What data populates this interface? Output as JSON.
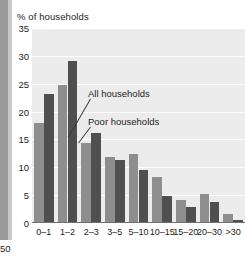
{
  "chart_data": {
    "type": "bar",
    "title": "% of households",
    "xlabel": "",
    "ylabel": "% of households",
    "ylim": [
      0,
      35
    ],
    "yticks": [
      0,
      5,
      10,
      15,
      20,
      25,
      30,
      35
    ],
    "ytick_labels": [
      "0",
      "5",
      "10",
      "15",
      "20",
      "25",
      "30",
      "35"
    ],
    "grid": true,
    "legend_position": "inline-annotations",
    "categories": [
      "0–1",
      "1–2",
      "2–3",
      "3–5",
      "5–10",
      "10–15",
      "15–20",
      "20–30",
      ">30"
    ],
    "series": [
      {
        "name": "All households",
        "color": "#8e8e8e",
        "values": [
          18.0,
          24.8,
          14.3,
          11.8,
          12.3,
          8.2,
          4.2,
          5.2,
          1.7
        ]
      },
      {
        "name": "Poor households",
        "color": "#4f4f4f",
        "values": [
          23.1,
          29.0,
          16.1,
          11.3,
          9.6,
          4.8,
          2.8,
          3.7,
          0.5
        ]
      }
    ],
    "annotations": [
      {
        "text": "All households",
        "target_series": "All households",
        "target_category": "2–3"
      },
      {
        "text": "Poor households",
        "target_series": "Poor households",
        "target_category": "2–3"
      }
    ]
  },
  "neighbour_axis": {
    "cropped_tick_label": "50"
  },
  "colors": {
    "plot_background": "#ececec",
    "gridline": "#ffffff",
    "axis": "#6f6f6f",
    "text": "#1d1d1d",
    "series_all": "#8e8e8e",
    "series_poor": "#4f4f4f",
    "page_edge": "#9a9a9a"
  }
}
